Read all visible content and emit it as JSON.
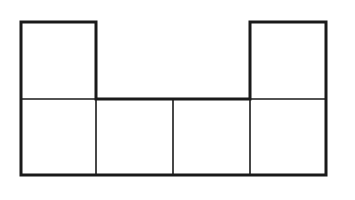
{
  "diagram": {
    "title": "",
    "stroke_color": "#1a1a1a",
    "background": "#ffffff",
    "grid": {
      "columns": 4,
      "rows": 2
    },
    "cells": [
      {
        "row": 0,
        "col": 0
      },
      {
        "row": 0,
        "col": 3
      },
      {
        "row": 1,
        "col": 0
      },
      {
        "row": 1,
        "col": 1
      },
      {
        "row": 1,
        "col": 2
      },
      {
        "row": 1,
        "col": 3
      }
    ]
  }
}
